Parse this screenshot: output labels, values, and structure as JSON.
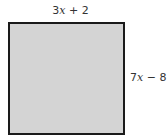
{
  "diagram": {
    "shape": "square",
    "fill_color": "#d4d4d4",
    "border_color": "#1a1a1a",
    "top_side": {
      "coefficient": "3",
      "variable": "x",
      "rest": " + 2",
      "full": "3x + 2"
    },
    "right_side": {
      "coefficient": "7",
      "variable": "x",
      "rest": " − 8",
      "full": "7x − 8"
    }
  }
}
